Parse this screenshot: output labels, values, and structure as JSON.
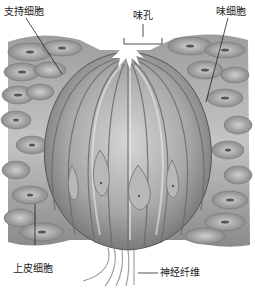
{
  "labels": {
    "support_cell": "支持细胞",
    "taste_pore": "味孔",
    "taste_cell": "味细胞",
    "epithelial_cell": "上皮细胞",
    "nerve_fiber": "神经纤维"
  },
  "colors": {
    "background": "#ffffff",
    "tissue_dark": "#5a5a5a",
    "tissue_mid": "#9a9a9a",
    "tissue_light": "#d8d8d8",
    "leader_line": "#222222"
  }
}
